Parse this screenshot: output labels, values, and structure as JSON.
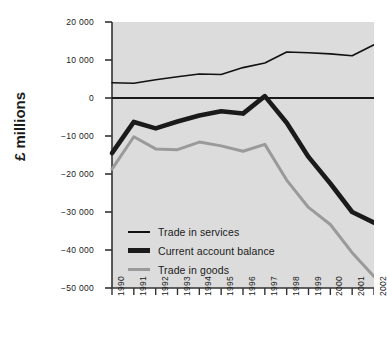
{
  "chart_data": {
    "type": "line",
    "title": "",
    "xlabel": "",
    "ylabel": "£ millions",
    "categories": [
      "1990",
      "1991",
      "1992",
      "1993",
      "1994",
      "1995",
      "1996",
      "1997",
      "1998",
      "1999",
      "2000",
      "2001",
      "2002"
    ],
    "x": [
      1990,
      1991,
      1992,
      1993,
      1994,
      1995,
      1996,
      1997,
      1998,
      1999,
      2000,
      2001,
      2002
    ],
    "ylim": [
      -50000,
      20000
    ],
    "xlim": [
      1990,
      2002
    ],
    "ytick_labels": [
      "20 000",
      "10 000",
      "0",
      "−10 000",
      "−20 000",
      "−30 000",
      "−40 000",
      "−50 000"
    ],
    "ytick_values": [
      20000,
      10000,
      0,
      -10000,
      -20000,
      -30000,
      -40000,
      -50000
    ],
    "grid": false,
    "legend_position": "inside-lower-left",
    "series": [
      {
        "name": "Trade in services",
        "color": "#111111",
        "width": 1.6,
        "values": [
          4000,
          3900,
          4800,
          5600,
          6300,
          6200,
          8000,
          9200,
          12100,
          11900,
          11600,
          11100,
          14000
        ]
      },
      {
        "name": "Current account balance",
        "color": "#1a1a1a",
        "width": 4.6,
        "values": [
          -14500,
          -6300,
          -8000,
          -6200,
          -4600,
          -3500,
          -4100,
          500,
          -6500,
          -15500,
          -22500,
          -30000,
          -32800
        ]
      },
      {
        "name": "Trade in goods",
        "color": "#9a9a9a",
        "width": 3.0,
        "values": [
          -18700,
          -10200,
          -13400,
          -13600,
          -11600,
          -12600,
          -14000,
          -12200,
          -21600,
          -28800,
          -33300,
          -40700,
          -47000
        ]
      }
    ]
  },
  "legend": {
    "items": [
      {
        "label": "Trade in services"
      },
      {
        "label": "Current account balance"
      },
      {
        "label": "Trade in goods"
      }
    ]
  },
  "plot_style": {
    "plot_background": "#dcdcdc",
    "page_background": "#ffffff",
    "axis_color": "#333333",
    "zero_line_color": "#1a1a1a"
  }
}
